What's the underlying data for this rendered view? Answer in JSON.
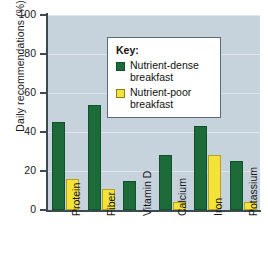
{
  "chart_data": {
    "type": "bar",
    "title": "",
    "xlabel": "",
    "ylabel": "Daily recommendations (%)",
    "ylim": [
      0,
      100
    ],
    "yticks": [
      0,
      20,
      40,
      60,
      80,
      100
    ],
    "grid": false,
    "legend_position": "top-left-inside",
    "legend_title": "Key:",
    "categories": [
      "Protein",
      "Fiber",
      "Vitamin D",
      "Calcium",
      "Iron",
      "Potassium"
    ],
    "series": [
      {
        "name": "Nutrient-dense breakfast",
        "color": "#1d6b39",
        "values": [
          45,
          54,
          15,
          28,
          43,
          25
        ]
      },
      {
        "name": "Nutrient-poor breakfast",
        "color": "#f3e23a",
        "values": [
          16,
          11,
          0,
          4,
          28,
          4
        ]
      }
    ]
  },
  "legend": {
    "title": "Key:",
    "entries": [
      {
        "label_line1": "Nutrient-dense",
        "label_line2": "breakfast",
        "swatch": "dense"
      },
      {
        "label_line1": "Nutrient-poor",
        "label_line2": "breakfast",
        "swatch": "poor"
      }
    ]
  },
  "colors": {
    "plot_background": "#c6d2dc",
    "axis": "#3d4a52",
    "dense_green": "#1d6b39",
    "poor_yellow": "#f3e23a",
    "page_background": "#ffffff"
  }
}
